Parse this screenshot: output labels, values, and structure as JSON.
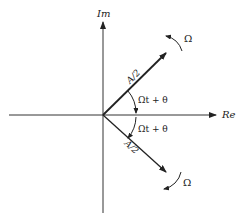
{
  "diagram": {
    "axes": {
      "imag_label": "Im",
      "real_label": "Re"
    },
    "phasors": [
      {
        "id": "upper",
        "magnitude_label": "A/2",
        "angle_label": "Ωt + θ",
        "rotation_label": "Ω",
        "direction": "counter-clockwise"
      },
      {
        "id": "lower",
        "magnitude_label": "A/2",
        "angle_label": "Ωt + θ",
        "rotation_label": "Ω",
        "direction": "clockwise"
      }
    ],
    "colors": {
      "line": "#222222",
      "background": "#ffffff"
    }
  }
}
